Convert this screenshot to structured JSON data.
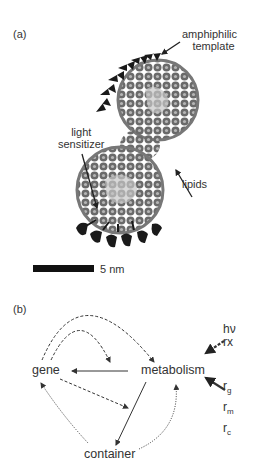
{
  "panel_a": {
    "label": "(a)",
    "annotations": {
      "template_line1": "amphiphilic",
      "template_line2": "template",
      "sensitizer_line1": "light",
      "sensitizer_line2": "sensitizer",
      "lipids": "lipids"
    },
    "scale_bar": "5 nm"
  },
  "panel_b": {
    "label": "(b)",
    "nodes": {
      "gene": "gene",
      "metabolism": "metabolism",
      "container": "container"
    },
    "inputs": {
      "energy_line1": "hν",
      "energy_line2": "rx",
      "resources": [
        {
          "base": "r",
          "sub": "g"
        },
        {
          "base": "r",
          "sub": "m"
        },
        {
          "base": "r",
          "sub": "c"
        }
      ]
    },
    "edges": [
      {
        "from": "metabolism",
        "to": "gene",
        "style": "solid"
      },
      {
        "from": "metabolism",
        "to": "container",
        "style": "solid"
      },
      {
        "from": "gene",
        "to": "metabolism",
        "style": "dashed",
        "curve": "outer arc"
      },
      {
        "from": "gene",
        "to": "gene-metabolism link",
        "style": "dashed",
        "curve": "inner arc"
      },
      {
        "from": "gene",
        "to": "container-metabolism link",
        "style": "dashed"
      },
      {
        "from": "container",
        "to": "gene",
        "style": "dotted"
      },
      {
        "from": "container",
        "to": "metabolism",
        "style": "dotted"
      },
      {
        "from": "hν rx",
        "to": "metabolism",
        "style": "dashed-thick"
      },
      {
        "from": "rg rm rc",
        "to": "metabolism",
        "style": "solid-thick"
      }
    ]
  }
}
